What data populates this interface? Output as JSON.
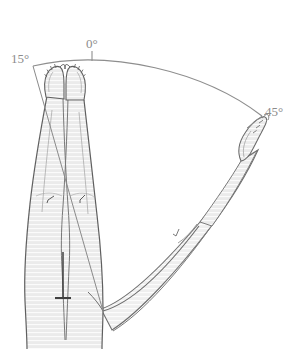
{
  "illustration": {
    "title": "Hip abduction range of motion",
    "description": "Anatomical line drawing, anterior view of lower limbs. The left limb remains in neutral alignment while the right limb is abducted, with a measurement arc spanning from 15 degrees of adduction through 0 degrees neutral to 45 degrees of abduction.",
    "view": "anterior"
  },
  "measurements": {
    "arc_labels": [
      {
        "id": "adduction",
        "value": "15°",
        "position": "left"
      },
      {
        "id": "neutral",
        "value": "0°",
        "position": "top"
      },
      {
        "id": "abduction",
        "value": "45°",
        "position": "right"
      }
    ]
  },
  "anatomy": {
    "parts": [
      {
        "name": "neutral-limb",
        "label": "Neutral limb"
      },
      {
        "name": "abducted-limb",
        "label": "Abducted limb"
      },
      {
        "name": "neutral-foot-left",
        "label": "Left foot"
      },
      {
        "name": "neutral-foot-right",
        "label": "Right foot"
      },
      {
        "name": "abducted-foot",
        "label": "Abducted foot"
      },
      {
        "name": "pelvis-block",
        "label": "Pelvis"
      }
    ]
  },
  "colors": {
    "background": "#ffffff",
    "ink": "#5a5a5a",
    "ink_light": "#8c8c8c",
    "skin_fill": "#ebebeb",
    "skin_fill_deep": "#e2e2e2",
    "hatch": "#f7f7f7",
    "arc": "#8e8e8e",
    "label_text": "#8c8c8c"
  }
}
